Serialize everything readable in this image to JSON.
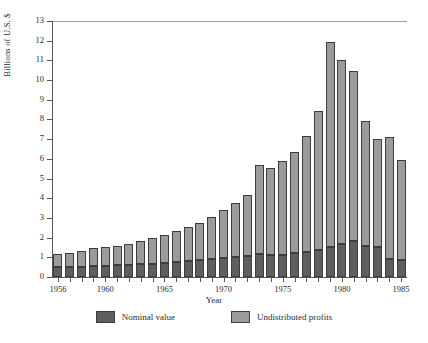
{
  "chart_data": {
    "type": "bar",
    "stacked": true,
    "title": "",
    "xlabel": "Year",
    "ylabel": "Billions of U.S. $",
    "ylim": [
      0,
      13
    ],
    "yticks": [
      0,
      1,
      2,
      3,
      4,
      5,
      6,
      7,
      8,
      9,
      10,
      11,
      12,
      13
    ],
    "xlim": [
      1955.5,
      1985.5
    ],
    "xtick_labels": [
      "1956",
      "1960",
      "1965",
      "1970",
      "1975",
      "1980",
      "1985"
    ],
    "xtick_values": [
      1956,
      1960,
      1965,
      1970,
      1975,
      1980,
      1985
    ],
    "grid": false,
    "legend_position": "bottom",
    "categories": [
      1956,
      1957,
      1958,
      1959,
      1960,
      1961,
      1962,
      1963,
      1964,
      1965,
      1966,
      1967,
      1968,
      1969,
      1970,
      1971,
      1972,
      1973,
      1974,
      1975,
      1976,
      1977,
      1978,
      1979,
      1980,
      1981,
      1982,
      1983,
      1984,
      1985
    ],
    "series": [
      {
        "name": "Nominal value",
        "color": "#5f5f5f",
        "values": [
          0.5,
          0.5,
          0.5,
          0.55,
          0.55,
          0.6,
          0.6,
          0.65,
          0.65,
          0.7,
          0.75,
          0.8,
          0.85,
          0.9,
          0.95,
          1.0,
          1.05,
          1.15,
          1.1,
          1.1,
          1.2,
          1.25,
          1.35,
          1.5,
          1.7,
          1.85,
          1.55,
          1.5,
          0.9,
          0.85
        ]
      },
      {
        "name": "Undistributed profits",
        "color": "#9b9b9b",
        "values": [
          0.65,
          0.7,
          0.8,
          0.9,
          0.95,
          1.0,
          1.1,
          1.2,
          1.35,
          1.45,
          1.6,
          1.75,
          1.9,
          2.15,
          2.45,
          2.75,
          3.1,
          4.55,
          4.45,
          4.8,
          5.15,
          5.9,
          7.1,
          10.45,
          9.3,
          8.6,
          6.35,
          5.5,
          6.2,
          5.1
        ]
      }
    ],
    "totals": [
      1.15,
      1.2,
      1.3,
      1.45,
      1.5,
      1.6,
      1.7,
      1.85,
      2.0,
      2.15,
      2.35,
      2.55,
      2.75,
      3.05,
      3.4,
      3.75,
      4.15,
      5.7,
      5.55,
      5.9,
      6.35,
      7.15,
      8.45,
      11.95,
      11.0,
      10.45,
      7.9,
      7.0,
      7.1,
      5.95
    ]
  },
  "legend": {
    "items": [
      {
        "label": "Nominal value",
        "color": "#5f5f5f"
      },
      {
        "label": "Undistributed profits",
        "color": "#9b9b9b"
      }
    ]
  }
}
